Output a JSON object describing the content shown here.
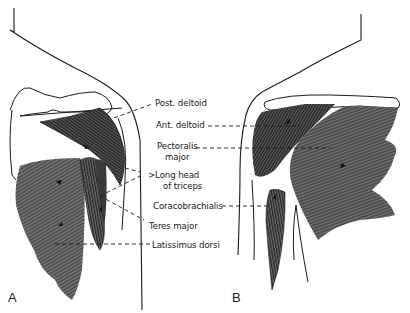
{
  "figure": {
    "panels": [
      {
        "id": "A",
        "label": "A",
        "view": "posterior"
      },
      {
        "id": "B",
        "label": "B",
        "view": "anterior"
      }
    ],
    "labels": [
      {
        "key": "post_deltoid",
        "text": "Post. deltoid"
      },
      {
        "key": "ant_deltoid",
        "text": "Ant. deltoid"
      },
      {
        "key": "pectoralis_major_1",
        "text": "Pectoralis"
      },
      {
        "key": "pectoralis_major_2",
        "text": "major"
      },
      {
        "key": "long_head_triceps_1",
        "text": ">Long head"
      },
      {
        "key": "long_head_triceps_2",
        "text": "of triceps"
      },
      {
        "key": "coracobrachialis",
        "text": "Coracobrachialis"
      },
      {
        "key": "teres_major",
        "text": "Teres major"
      },
      {
        "key": "latissimus_dorsi",
        "text": "Latissimus dorsi"
      }
    ],
    "colors": {
      "ink": "#1a1a1a",
      "muscle_dark": "#3a3a3a",
      "muscle_mid": "#6e6e6e",
      "muscle_light": "#8c8c8c",
      "background": "#ffffff"
    }
  }
}
